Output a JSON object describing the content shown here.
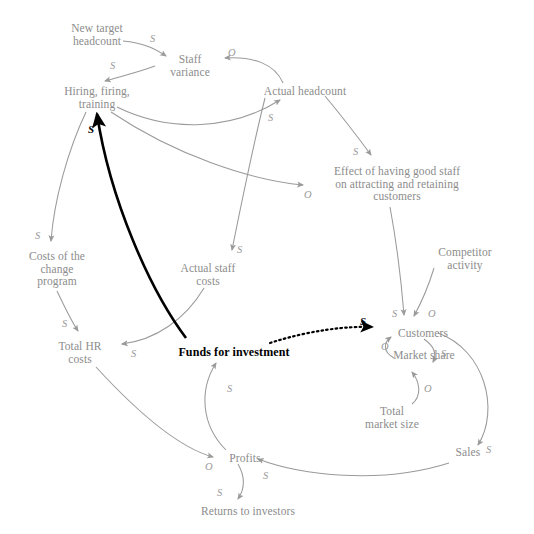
{
  "diagram": {
    "ghost_fragment": "",
    "colors": {
      "node_text": "#8c8c8c",
      "link_text": "#9a9a9a",
      "arrow_gray": "#9a9a9a",
      "arrow_black": "#000000",
      "background": "#ffffff"
    },
    "nodes": [
      {
        "id": "new-target-headcount",
        "label": "New target\nheadcount",
        "x": 52,
        "y": 22,
        "width": 90,
        "emphasis": false
      },
      {
        "id": "staff-variance",
        "label": "Staff\nvariance",
        "x": 154,
        "y": 53,
        "width": 72,
        "emphasis": false
      },
      {
        "id": "hiring-firing-training",
        "label": "Hiring, firing,\ntraining",
        "x": 47,
        "y": 85,
        "width": 100,
        "emphasis": false
      },
      {
        "id": "actual-headcount",
        "label": "Actual headcount",
        "x": 247,
        "y": 85,
        "width": 116,
        "emphasis": false
      },
      {
        "id": "effect-of-good-staff",
        "label": "Effect of having good staff\non attracting and retaining\ncustomers",
        "x": 307,
        "y": 165,
        "width": 180,
        "emphasis": false
      },
      {
        "id": "competitor-activity",
        "label": "Competitor\nactivity",
        "x": 424,
        "y": 246,
        "width": 82,
        "emphasis": false
      },
      {
        "id": "costs-of-change-program",
        "label": "Costs of the\nchange\nprogram",
        "x": 17,
        "y": 250,
        "width": 80,
        "emphasis": false
      },
      {
        "id": "actual-staff-costs",
        "label": "Actual staff\ncosts",
        "x": 168,
        "y": 262,
        "width": 80,
        "emphasis": false
      },
      {
        "id": "total-hr-costs",
        "label": "Total HR\ncosts",
        "x": 47,
        "y": 340,
        "width": 66,
        "emphasis": false
      },
      {
        "id": "funds-for-investment",
        "label": "Funds for investment",
        "x": 168,
        "y": 346,
        "width": 132,
        "emphasis": true
      },
      {
        "id": "customers",
        "label": "Customers",
        "x": 385,
        "y": 327,
        "width": 76,
        "emphasis": false
      },
      {
        "id": "market-share",
        "label": "Market share",
        "x": 379,
        "y": 349,
        "width": 90,
        "emphasis": false
      },
      {
        "id": "total-market-size",
        "label": "Total\nmarket size",
        "x": 354,
        "y": 405,
        "width": 76,
        "emphasis": false
      },
      {
        "id": "sales",
        "label": "Sales",
        "x": 447,
        "y": 446,
        "width": 42,
        "emphasis": false
      },
      {
        "id": "profits",
        "label": "Profits",
        "x": 221,
        "y": 452,
        "width": 48,
        "emphasis": false
      },
      {
        "id": "returns-to-investors",
        "label": "Returns to investors",
        "x": 186,
        "y": 505,
        "width": 124,
        "emphasis": false
      }
    ],
    "links": [
      {
        "id": "link-new-target-to-staff-variance",
        "from": "new-target-headcount",
        "to": "staff-variance",
        "polarity": "S",
        "label_x": 150,
        "label_y": 33,
        "style": "gray",
        "path": "M 123 41 C 143 43 154 48 166 56"
      },
      {
        "id": "link-actual-headcount-to-staff-variance",
        "from": "actual-headcount",
        "to": "staff-variance",
        "polarity": "O",
        "label_x": 228,
        "label_y": 47,
        "style": "gray",
        "path": "M 283 83 C 275 64 253 56 225 58"
      },
      {
        "id": "link-staff-variance-to-hiring",
        "from": "staff-variance",
        "to": "hiring-firing-training",
        "polarity": "S",
        "label_x": 110,
        "label_y": 60,
        "style": "gray",
        "path": "M 155 66 C 136 73 118 77 105 81"
      },
      {
        "id": "link-hiring-to-actual-headcount",
        "from": "hiring-firing-training",
        "to": "actual-headcount",
        "polarity": "S",
        "label_x": 268,
        "label_y": 112,
        "style": "gray",
        "path": "M 117 107 C 170 133 232 130 280 100"
      },
      {
        "id": "link-hiring-to-effect-of-good-staff",
        "from": "hiring-firing-training",
        "to": "effect-of-good-staff",
        "polarity": "O",
        "label_x": 304,
        "label_y": 189,
        "style": "gray",
        "path": "M 111 112 C 175 155 250 180 303 185"
      },
      {
        "id": "link-actual-headcount-to-effect",
        "from": "actual-headcount",
        "to": "effect-of-good-staff",
        "polarity": "S",
        "label_x": 353,
        "label_y": 146,
        "style": "gray",
        "path": "M 325 96 C 345 120 360 140 371 155"
      },
      {
        "id": "link-actual-headcount-to-actual-staff-costs",
        "from": "actual-headcount",
        "to": "actual-staff-costs",
        "polarity": "S",
        "label_x": 237,
        "label_y": 244,
        "style": "gray",
        "path": "M 265 98 C 252 150 240 210 232 250"
      },
      {
        "id": "link-hiring-to-costs-of-change",
        "from": "hiring-firing-training",
        "to": "costs-of-change-program",
        "polarity": "S",
        "label_x": 35,
        "label_y": 230,
        "style": "gray",
        "path": "M 86 112 C 68 150 54 200 51 241"
      },
      {
        "id": "link-costs-of-change-to-total-hr",
        "from": "costs-of-change-program",
        "to": "total-hr-costs",
        "polarity": "S",
        "label_x": 62,
        "label_y": 318,
        "style": "gray",
        "path": "M 57 291 C 66 310 72 322 78 331"
      },
      {
        "id": "link-actual-staff-costs-to-total-hr",
        "from": "actual-staff-costs",
        "to": "total-hr-costs",
        "polarity": "S",
        "label_x": 131,
        "label_y": 348,
        "style": "gray",
        "path": "M 204 288 C 185 320 155 340 122 344"
      },
      {
        "id": "link-effect-to-customers",
        "from": "effect-of-good-staff",
        "to": "customers",
        "polarity": "S",
        "label_x": 392,
        "label_y": 308,
        "style": "gray",
        "path": "M 390 207 C 398 250 402 290 404 315"
      },
      {
        "id": "link-competitor-to-customers",
        "from": "competitor-activity",
        "to": "customers",
        "polarity": "O",
        "label_x": 428,
        "label_y": 308,
        "style": "gray",
        "path": "M 434 268 C 428 288 420 305 414 316"
      },
      {
        "id": "link-funds-to-customers",
        "from": "funds-for-investment",
        "to": "customers",
        "polarity": "S",
        "label_x": 360,
        "label_y": 316,
        "style": "dotted-bold",
        "path": "M 270 343 C 310 330 348 326 372 327"
      },
      {
        "id": "link-funds-to-hiring",
        "from": "funds-for-investment",
        "to": "hiring-firing-training",
        "polarity": "S",
        "label_x": 88,
        "label_y": 124,
        "style": "black-bold",
        "path": "M 186 338 C 150 290 110 200 97 114"
      },
      {
        "id": "link-profits-to-funds",
        "from": "profits",
        "to": "funds-for-investment",
        "polarity": "S",
        "label_x": 227,
        "label_y": 383,
        "style": "gray",
        "path": "M 226 450 C 201 425 199 390 216 363"
      },
      {
        "id": "link-total-hr-to-profits",
        "from": "total-hr-costs",
        "to": "profits",
        "polarity": "O",
        "label_x": 205,
        "label_y": 461,
        "style": "gray",
        "path": "M 96 367 C 140 415 180 448 213 457"
      },
      {
        "id": "link-customers-to-market-share",
        "from": "customers",
        "to": "market-share",
        "polarity": "S",
        "label_x": 441,
        "label_y": 348,
        "style": "gray",
        "path": "M 424 339 C 434 346 437 354 433 362"
      },
      {
        "id": "link-market-share-to-customers",
        "from": "market-share",
        "to": "customers",
        "polarity": "O",
        "label_x": 381,
        "label_y": 341,
        "style": "gray",
        "path": "M 394 358 C 383 352 383 343 391 337"
      },
      {
        "id": "link-total-market-size-to-market-share",
        "from": "total-market-size",
        "to": "market-share",
        "polarity": "O",
        "label_x": 424,
        "label_y": 383,
        "style": "gray",
        "path": "M 412 404 C 422 396 420 382 412 372"
      },
      {
        "id": "link-customers-to-sales",
        "from": "customers",
        "to": "sales",
        "polarity": "S",
        "label_x": 486,
        "label_y": 444,
        "style": "gray",
        "path": "M 438 333 C 485 350 500 410 478 445"
      },
      {
        "id": "link-sales-to-profits",
        "from": "sales",
        "to": "profits",
        "polarity": "S",
        "label_x": 263,
        "label_y": 470,
        "style": "gray",
        "path": "M 449 463 C 380 485 300 475 258 459"
      },
      {
        "id": "link-profits-to-returns",
        "from": "profits",
        "to": "returns-to-investors",
        "polarity": "S",
        "label_x": 217,
        "label_y": 487,
        "style": "gray",
        "path": "M 238 464 C 246 478 244 490 238 499"
      }
    ]
  }
}
